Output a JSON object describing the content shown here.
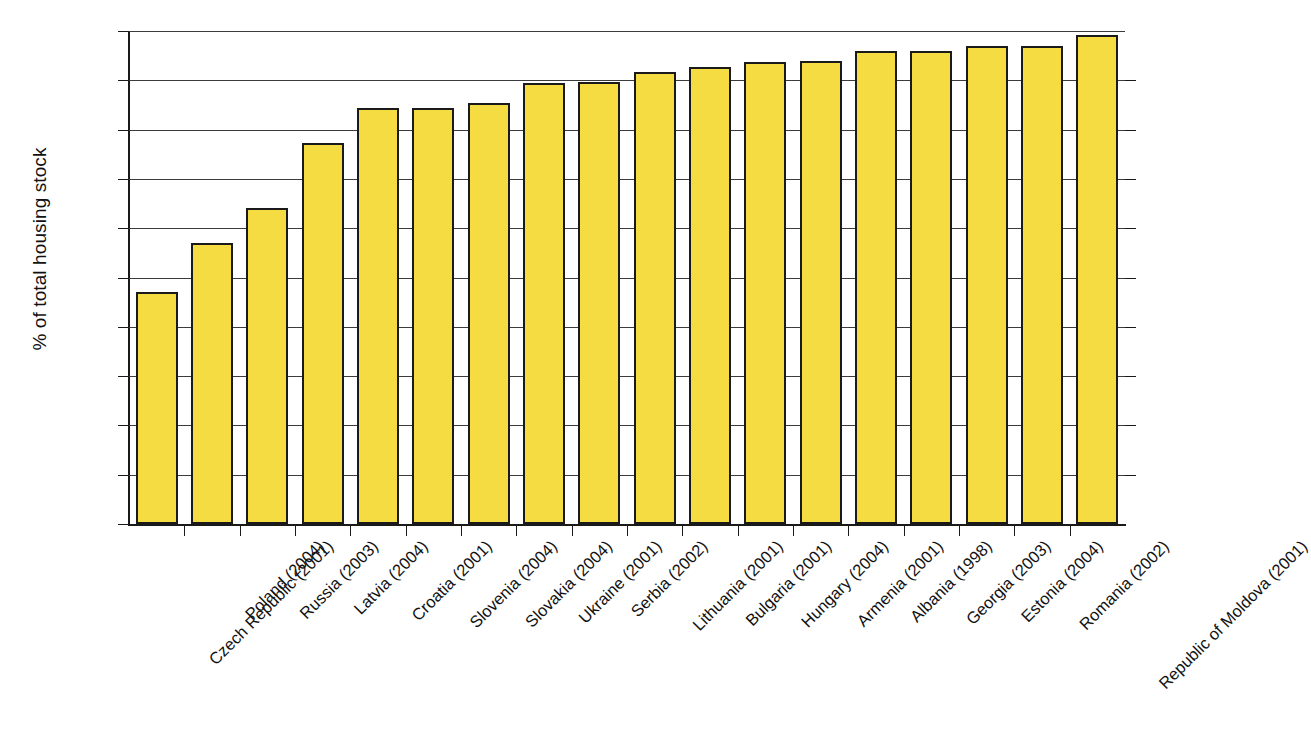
{
  "chart_data": {
    "type": "bar",
    "title": "",
    "xlabel": "",
    "ylabel": "% of total housing stock",
    "ylim": [
      0,
      100
    ],
    "ytick_step": 10,
    "yticks": [
      0,
      10,
      20,
      30,
      40,
      50,
      60,
      70,
      80,
      90,
      100
    ],
    "ytick_labels": [
      "0",
      "10",
      "20",
      "30",
      "40",
      "50",
      "60",
      "70",
      "80",
      "90",
      "100"
    ],
    "grid": true,
    "legend": false,
    "bar_color": "#F5DC42",
    "bar_edge_color": "#1a1a1a",
    "axis_color": "#1a1a1a",
    "categories": [
      "Czech Republic (2001)",
      "Poland (2004)",
      "Russia (2003)",
      "Latvia (2004)",
      "Croatia (2001)",
      "Slovenia (2004)",
      "Slovakia (2004)",
      "Ukraine (2001)",
      "Serbia (2002)",
      "Lithuania (2001)",
      "Bulgaria (2001)",
      "Hungary (2004)",
      "Armenia (2001)",
      "Albania (1998)",
      "Georgia (2003)",
      "Estonia (2004)",
      "Romania (2002)",
      "Republic of Moldova (2001)"
    ],
    "values": [
      47,
      57,
      64,
      77.2,
      84.3,
      84.3,
      85.5,
      89.5,
      89.7,
      91.6,
      92.7,
      93.8,
      93.9,
      95.9,
      95.9,
      97,
      97,
      99.1
    ]
  }
}
